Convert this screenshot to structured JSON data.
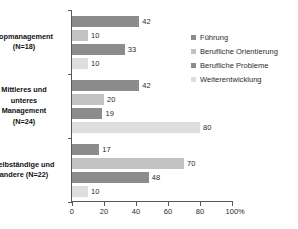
{
  "chart_data": {
    "type": "bar",
    "orientation": "horizontal",
    "title": "",
    "xlabel": "%",
    "ylabel": "",
    "xlim": [
      0,
      100
    ],
    "xticks": [
      0,
      20,
      40,
      60,
      80,
      100
    ],
    "grid": false,
    "legend_position": "right",
    "categories": [
      "Topmanagement (N=18)",
      "Mittleres und unteres Management (N=24)",
      "Selbständige und andere (N=22)"
    ],
    "category_lines": [
      [
        "Topmanagement",
        "(N=18)"
      ],
      [
        "Mittleres und",
        "unteres",
        "Management",
        "(N=24)"
      ],
      [
        "Selbständige und",
        "andere (N=22)"
      ]
    ],
    "series": [
      {
        "name": "Führung",
        "color": "#8c8c8c",
        "values": [
          42,
          42,
          17
        ]
      },
      {
        "name": "Berufliche Orientierung",
        "color": "#c2c2c2",
        "values": [
          10,
          20,
          70
        ]
      },
      {
        "name": "Berufliche Probleme",
        "color": "#8c8c8c",
        "values": [
          33,
          19,
          48
        ]
      },
      {
        "name": "Weiterentwicklung",
        "color": "#dedede",
        "values": [
          10,
          80,
          10
        ]
      }
    ]
  },
  "legend": {
    "items": [
      {
        "label": "Führung",
        "color": "#8c8c8c"
      },
      {
        "label": "Berufliche Orientierung",
        "color": "#c2c2c2"
      },
      {
        "label": "Berufliche Probleme",
        "color": "#8c8c8c"
      },
      {
        "label": "Weiterentwicklung",
        "color": "#dedede"
      }
    ]
  },
  "axis": {
    "x_unit": "%",
    "x_tick_labels": [
      "0",
      "20",
      "40",
      "60",
      "80",
      "100"
    ]
  }
}
